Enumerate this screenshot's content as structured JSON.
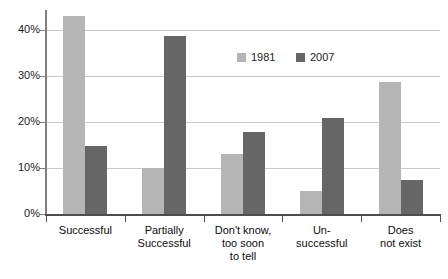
{
  "chart_data": {
    "type": "bar",
    "title": "",
    "subtitle": "",
    "xlabel": "",
    "ylabel": "",
    "ylim": [
      0,
      45
    ],
    "ytick_values": [
      0,
      10,
      20,
      30,
      40
    ],
    "ytick_labels": [
      "0%",
      "10%",
      "20%",
      "30%",
      "40%"
    ],
    "grid": true,
    "legend_position": "top-center-right",
    "categories": [
      "Successful",
      "Partially\nSuccessful",
      "Don't know,\ntoo soon\nto tell",
      "Un-\nsuccessful",
      "Does\nnot exist"
    ],
    "category_lines": [
      [
        "Successful"
      ],
      [
        "Partially",
        "Successful"
      ],
      [
        "Don't know,",
        "too soon",
        "to tell"
      ],
      [
        "Un-",
        "successful"
      ],
      [
        "Does",
        "not exist"
      ]
    ],
    "series": [
      {
        "name": "1981",
        "color": "#b5b5b5",
        "values": [
          43.0,
          10.0,
          13.0,
          5.0,
          28.8
        ]
      },
      {
        "name": "2007",
        "color": "#666666",
        "values": [
          14.8,
          38.7,
          17.8,
          20.8,
          7.5
        ]
      }
    ]
  },
  "legend": {
    "items": [
      {
        "label": "1981",
        "color": "#b5b5b5"
      },
      {
        "label": "2007",
        "color": "#666666"
      }
    ]
  },
  "colors": {
    "series_1981": "#b5b5b5",
    "series_2007": "#666666",
    "gridline": "#c9c9c9",
    "axis": "#4d4d4d",
    "background": "#ffffff",
    "text": "#1a1a1a"
  }
}
